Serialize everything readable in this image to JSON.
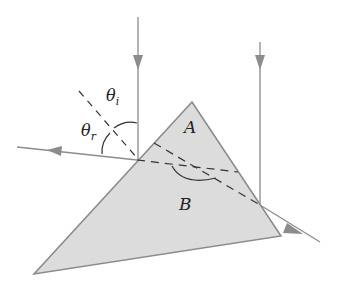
{
  "diagram": {
    "type": "optics-prism-reflection",
    "labels": {
      "theta_i": "θ",
      "theta_i_sub": "i",
      "theta_r": "θ",
      "theta_r_sub": "r",
      "region_a": "A",
      "region_b": "B"
    },
    "colors": {
      "prism_fill": "#dcdcdc",
      "prism_stroke": "#8a8a8a",
      "ray": "#8c8c8c",
      "dashed": "#333333",
      "text": "#222222"
    }
  }
}
